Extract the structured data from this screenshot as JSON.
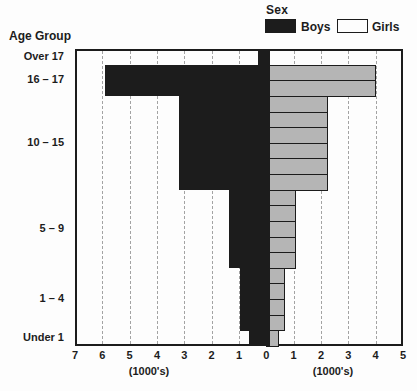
{
  "legend": {
    "title": "Sex",
    "items": [
      {
        "label": "Boys",
        "color": "#1c1c1c"
      },
      {
        "label": "Girls",
        "color": "#b5b5b5"
      }
    ]
  },
  "axis": {
    "ylabel": "Age Group",
    "left_unit_label": "(1000's)",
    "right_unit_label": "(1000's)",
    "left_max": 7,
    "right_max": 5
  },
  "colors": {
    "boys": "#1c1c1c",
    "girls": "#b5b5b5",
    "grid": "#a3a3a3",
    "border": "#1c1c1c",
    "background": "#fdfdfd"
  },
  "chart_data": {
    "type": "bar",
    "subtype": "population-pyramid",
    "title": "Sex",
    "ylabel": "Age Group",
    "xlabel_left": "(1000's)",
    "xlabel_right": "(1000's)",
    "x_range_left": [
      0,
      7
    ],
    "x_range_right": [
      0,
      5
    ],
    "x_ticks": [
      7,
      6,
      5,
      4,
      3,
      2,
      1,
      0,
      1,
      2,
      3,
      4,
      5
    ],
    "grid": "vertical-dashed",
    "legend_position": "top-right",
    "units": "thousands",
    "row_count": 19,
    "groups": [
      {
        "label": "Over 17",
        "rows": 1,
        "boys_per_row": 0.3,
        "girls_per_row": 0
      },
      {
        "label": "16 – 17",
        "rows": 2,
        "boys_per_row": 5.9,
        "girls_per_row": 4.0
      },
      {
        "label": "10 – 15",
        "rows": 6,
        "boys_per_row": 3.2,
        "girls_per_row": 2.25
      },
      {
        "label": "5 – 9",
        "rows": 5,
        "boys_per_row": 1.35,
        "girls_per_row": 1.1
      },
      {
        "label": "1 – 4",
        "rows": 4,
        "boys_per_row": 0.95,
        "girls_per_row": 0.7
      },
      {
        "label": "Under 1",
        "rows": 1,
        "boys_per_row": 0.65,
        "girls_per_row": 0.45
      }
    ],
    "series": [
      {
        "name": "Boys",
        "side": "left",
        "color": "#1c1c1c"
      },
      {
        "name": "Girls",
        "side": "right",
        "color": "#b5b5b5"
      }
    ]
  }
}
